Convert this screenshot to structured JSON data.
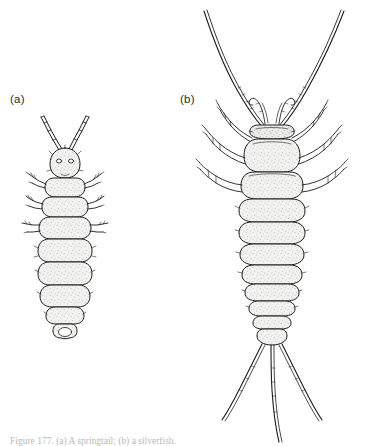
{
  "figure": {
    "background_color": "#ffffff",
    "ink_color": "#1c1c1c",
    "stipple_fill_color": "#e9e9e6",
    "caption": "Figure 177. (a) A springtail; (b) a silverfish.",
    "panels": [
      {
        "id": "a",
        "label": "(a)",
        "subject": "springtail",
        "order": "Collembola",
        "style": "stippled line drawing, dorsal view",
        "features": {
          "antennae": 2,
          "antenna_segments": 4,
          "eyes": 2,
          "legs": 6,
          "thoracic_segments": 3,
          "abdominal_segments": 6,
          "tail_filaments": 0,
          "furcula_visible": true,
          "wings": 0
        }
      },
      {
        "id": "b",
        "label": "(b)",
        "subject": "silverfish",
        "order": "Thysanura",
        "style": "stippled line drawing, dorsal view",
        "features": {
          "antennae": 2,
          "antenna_length": "long, exceeding body",
          "maxillary_palps": 2,
          "legs": 6,
          "thoracic_segments": 3,
          "abdominal_segments": 10,
          "tail_filaments": 3,
          "wings": 0
        }
      }
    ]
  }
}
